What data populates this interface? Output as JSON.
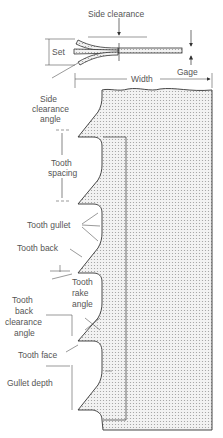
{
  "diagram": {
    "labels": {
      "side_clearance": "Side clearance",
      "set": "Set",
      "gage": "Gage",
      "width": "Width",
      "side_clearance_angle_1": "Side",
      "side_clearance_angle_2": "clearance",
      "side_clearance_angle_3": "angle",
      "tooth_spacing_1": "Tooth",
      "tooth_spacing_2": "spacing",
      "tooth_gullet": "Tooth gullet",
      "tooth_back": "Tooth back",
      "tooth_rake_angle_1": "Tooth",
      "tooth_rake_angle_2": "rake",
      "tooth_rake_angle_3": "angle",
      "tooth_back_clearance_angle_1": "Tooth",
      "tooth_back_clearance_angle_2": "back",
      "tooth_back_clearance_angle_3": "clearance",
      "tooth_back_clearance_angle_4": "angle",
      "tooth_face": "Tooth face",
      "gullet_depth": "Gullet depth"
    },
    "colors": {
      "line": "#333333",
      "fill": "#e6e6e6",
      "text": "#555555"
    }
  }
}
